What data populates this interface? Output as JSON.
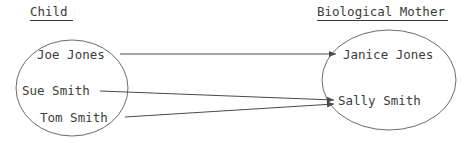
{
  "diagram": {
    "type": "mapping-diagram",
    "title_left": "Child",
    "title_right": "Biological Mother",
    "colors": {
      "background": "#ffffff",
      "ellipse_stroke": "#6b6b6b",
      "edge_stroke": "#4a4a4a",
      "text": "#3c3c3c",
      "heading_text": "#3a3a3a"
    },
    "headings": [
      {
        "label": "Child",
        "x": 30,
        "y": 16,
        "underline_x1": 30,
        "underline_x2": 73,
        "underline_y": 20
      },
      {
        "label": "Biological Mother",
        "x": 317,
        "y": 16,
        "underline_x1": 317,
        "underline_x2": 448,
        "underline_y": 20
      }
    ],
    "sets": [
      {
        "name": "child-set",
        "label": "Child",
        "shape": "ellipse",
        "cx": 72,
        "cy": 88,
        "rx": 56,
        "ry": 48,
        "members": [
          {
            "label": "Joe Jones",
            "x": 37,
            "y": 59
          },
          {
            "label": "Sue Smith",
            "x": 22,
            "y": 95
          },
          {
            "label": "Tom Smith",
            "x": 40,
            "y": 122
          }
        ]
      },
      {
        "name": "biological-mother-set",
        "label": "Biological Mother",
        "shape": "ellipse",
        "cx": 389,
        "cy": 80,
        "rx": 67,
        "ry": 50,
        "members": [
          {
            "label": "Janice Jones",
            "x": 343,
            "y": 59
          },
          {
            "label": "Sally Smith",
            "x": 338,
            "y": 105
          }
        ]
      }
    ],
    "edges": [
      {
        "name": "joe-to-janice",
        "from": "Joe Jones",
        "to": "Janice Jones",
        "x1": 120,
        "y1": 54,
        "x2": 336,
        "y2": 54
      },
      {
        "name": "sue-to-sally",
        "from": "Sue Smith",
        "to": "Sally Smith",
        "x1": 100,
        "y1": 91,
        "x2": 334,
        "y2": 100
      },
      {
        "name": "tom-to-sally",
        "from": "Tom Smith",
        "to": "Sally Smith",
        "x1": 125,
        "y1": 117,
        "x2": 334,
        "y2": 104
      }
    ]
  }
}
